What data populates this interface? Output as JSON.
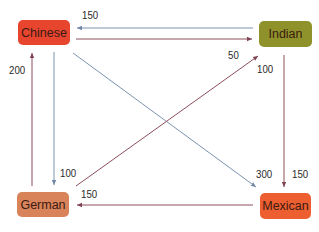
{
  "diagram": {
    "type": "directed-graph",
    "nodes": [
      {
        "id": "chinese",
        "label": "Chinese",
        "color": "#e8452f",
        "x": 18,
        "y": 20,
        "w": 52,
        "h": 25
      },
      {
        "id": "indian",
        "label": "Indian",
        "color": "#8f922a",
        "x": 259,
        "y": 21,
        "w": 53,
        "h": 26
      },
      {
        "id": "german",
        "label": "German",
        "color": "#d9835a",
        "x": 17,
        "y": 192,
        "w": 52,
        "h": 25
      },
      {
        "id": "mexican",
        "label": "Mexican",
        "color": "#ed5f30",
        "x": 260,
        "y": 193,
        "w": 51,
        "h": 26
      }
    ],
    "edges": [
      {
        "from": "indian",
        "to": "chinese",
        "value": "150",
        "color": "#7b93b0"
      },
      {
        "from": "chinese",
        "to": "indian",
        "value": "50",
        "color": "#8c4f5c"
      },
      {
        "from": "german",
        "to": "chinese",
        "value": "200",
        "color": "#8c4f5c"
      },
      {
        "from": "chinese",
        "to": "german",
        "value": "100",
        "color": "#7b93b0"
      },
      {
        "from": "chinese",
        "to": "mexican",
        "value": "300",
        "color": "#7b93b0"
      },
      {
        "from": "german",
        "to": "indian",
        "value": "100",
        "color": "#8c4f5c"
      },
      {
        "from": "indian",
        "to": "mexican",
        "value": "150",
        "color": "#8c4f5c"
      },
      {
        "from": "mexican",
        "to": "german",
        "value": "150",
        "color": "#8c4f5c"
      }
    ],
    "labels": {
      "indian_to_chinese": "150",
      "chinese_to_indian": "50",
      "german_to_chinese": "200",
      "chinese_to_german": "100",
      "chinese_to_mexican": "300",
      "german_to_indian": "100",
      "indian_to_mexican": "150",
      "mexican_to_german": "150"
    }
  }
}
